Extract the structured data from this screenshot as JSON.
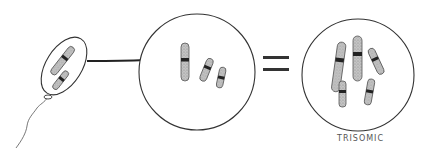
{
  "diagram": {
    "type": "biology-illustration",
    "panels": [
      {
        "name": "gamete-cell",
        "description": "flagellated cell containing two chromosomes"
      },
      {
        "name": "normal-nucleus",
        "description": "circle with three chromosomes"
      },
      {
        "name": "trisomic-nucleus",
        "description": "circle with five chromosomes"
      }
    ],
    "connectors": {
      "arrow": "arrow from gamete to nucleus",
      "equals": "="
    },
    "labels": {
      "trisomic": "TRISOMIC"
    },
    "colors": {
      "outline": "#333333",
      "chromosome_fill": "#b0b0b0",
      "centromere": "#222222"
    }
  }
}
